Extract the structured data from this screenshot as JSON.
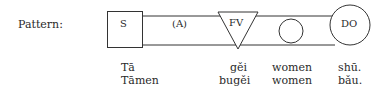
{
  "pattern_label": "Pattern:",
  "diagram": {
    "subject": "S",
    "adverbial": "(A)",
    "functive_verb": "FV",
    "indirect_object": "",
    "direct_object": "DO"
  },
  "examples": [
    {
      "subject": "Tā",
      "verb": "gěi",
      "indirect_object": "women",
      "direct_object": "shū."
    },
    {
      "subject": "Tāmen",
      "verb": "bugěi",
      "indirect_object": "women",
      "direct_object": "bǎu."
    }
  ]
}
